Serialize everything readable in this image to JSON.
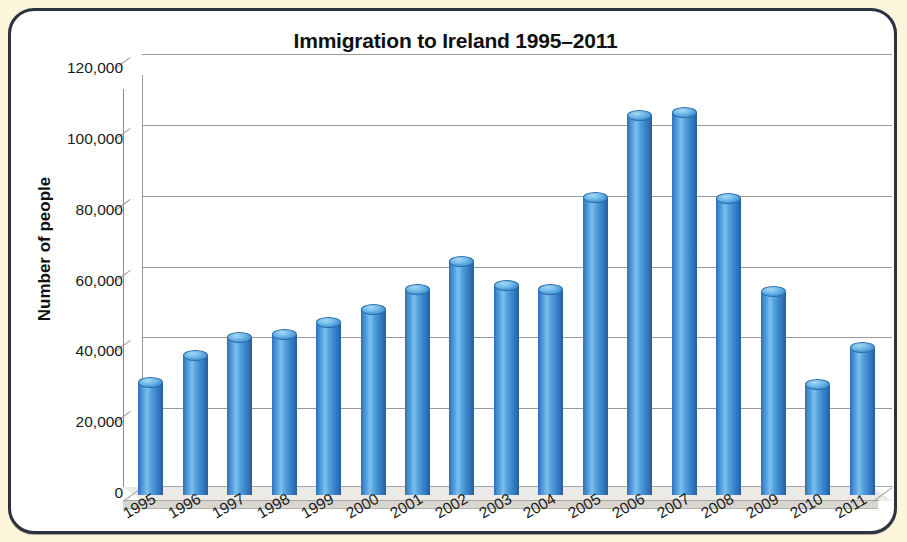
{
  "chart_data": {
    "type": "bar",
    "title": "Immigration to Ireland 1995–2011",
    "xlabel": "",
    "ylabel": "Number of people",
    "categories": [
      "1995",
      "1996",
      "1997",
      "1998",
      "1999",
      "2000",
      "2001",
      "2002",
      "2003",
      "2004",
      "2005",
      "2006",
      "2007",
      "2008",
      "2009",
      "2010",
      "2011"
    ],
    "values": [
      31600,
      39200,
      44300,
      45300,
      48500,
      52300,
      58000,
      65900,
      59000,
      58000,
      84000,
      107000,
      108000,
      83500,
      57300,
      31000,
      41500
    ],
    "ylim": [
      0,
      120000
    ],
    "ytick_labels": [
      "120,000",
      "100,000",
      "80,000",
      "60,000",
      "40,000",
      "20,000",
      "0"
    ],
    "ytick_values": [
      120000,
      100000,
      80000,
      60000,
      40000,
      20000,
      0
    ],
    "grid": true,
    "legend": null,
    "style": "3d-cylinder",
    "bar_color": "#4a95d2",
    "gridline_color": "#9a9a9a",
    "plot_background": "#ffffff",
    "page_background": "#fdf6dc",
    "frame_color": "#2b3340"
  }
}
